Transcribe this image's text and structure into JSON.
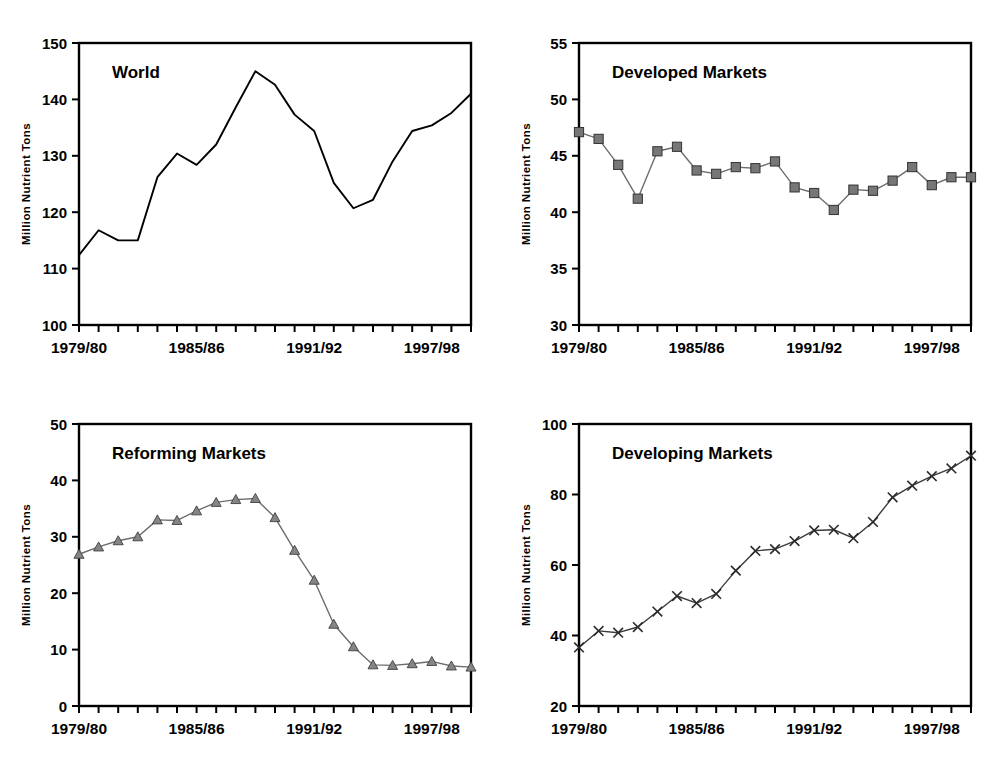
{
  "figure": {
    "panel_count": 4,
    "shared_ylabel": "Million Nutrient Tons",
    "shared_xtick_labels": [
      "1979/80",
      "1985/86",
      "1991/92",
      "1997/98"
    ],
    "shared_xtick_indices": [
      0,
      6,
      12,
      18
    ]
  },
  "chart_data": [
    {
      "type": "line",
      "title": "World",
      "xlabel": "",
      "ylabel": "Million Nutrient Tons",
      "ylim": [
        100,
        150
      ],
      "yticks": [
        100,
        110,
        120,
        130,
        140,
        150
      ],
      "xlim_labels": [
        "1979/80",
        "1999/2000"
      ],
      "grid": false,
      "legend": "none",
      "marker": "none",
      "categories": [
        "1979/80",
        "1980/81",
        "1981/82",
        "1982/83",
        "1983/84",
        "1984/85",
        "1985/86",
        "1986/87",
        "1987/88",
        "1988/89",
        "1989/90",
        "1990/91",
        "1991/92",
        "1992/93",
        "1993/94",
        "1994/95",
        "1995/96",
        "1996/97",
        "1997/98",
        "1998/99",
        "1999/00"
      ],
      "values": [
        112.4,
        116.8,
        115.0,
        115.0,
        126.2,
        130.4,
        128.4,
        132.0,
        138.6,
        145.0,
        142.6,
        137.3,
        134.4,
        125.2,
        120.7,
        122.2,
        129.0,
        134.4,
        135.4,
        137.6,
        141.0
      ]
    },
    {
      "type": "line",
      "title": "Developed Markets",
      "xlabel": "",
      "ylabel": "Million Nutrient Tons",
      "ylim": [
        30,
        55
      ],
      "yticks": [
        30,
        35,
        40,
        45,
        50,
        55
      ],
      "xlim_labels": [
        "1979/80",
        "1999/2000"
      ],
      "grid": false,
      "legend": "none",
      "marker": "square",
      "categories": [
        "1979/80",
        "1980/81",
        "1981/82",
        "1982/83",
        "1983/84",
        "1984/85",
        "1985/86",
        "1986/87",
        "1987/88",
        "1988/89",
        "1989/90",
        "1990/91",
        "1991/92",
        "1992/93",
        "1993/94",
        "1994/95",
        "1995/96",
        "1996/97",
        "1997/98",
        "1998/99",
        "1999/00"
      ],
      "values": [
        47.1,
        46.5,
        44.2,
        41.2,
        45.4,
        45.8,
        43.7,
        43.4,
        44.0,
        43.9,
        44.5,
        42.2,
        41.7,
        40.2,
        42.0,
        41.9,
        42.8,
        44.0,
        42.4,
        43.1,
        43.1
      ]
    },
    {
      "type": "line",
      "title": "Reforming Markets",
      "xlabel": "",
      "ylabel": "Million Nutrient Tons",
      "ylim": [
        0,
        50
      ],
      "yticks": [
        0,
        10,
        20,
        30,
        40,
        50
      ],
      "xlim_labels": [
        "1979/80",
        "1999/2000"
      ],
      "grid": false,
      "legend": "none",
      "marker": "triangle",
      "categories": [
        "1979/80",
        "1980/81",
        "1981/82",
        "1982/83",
        "1983/84",
        "1984/85",
        "1985/86",
        "1986/87",
        "1987/88",
        "1988/89",
        "1989/90",
        "1990/91",
        "1991/92",
        "1992/93",
        "1993/94",
        "1994/95",
        "1995/96",
        "1996/97",
        "1997/98",
        "1998/99",
        "1999/00"
      ],
      "values": [
        26.9,
        28.2,
        29.3,
        30.0,
        33.0,
        32.9,
        34.6,
        36.1,
        36.6,
        36.8,
        33.4,
        27.6,
        22.3,
        14.5,
        10.5,
        7.3,
        7.2,
        7.5,
        7.9,
        7.1,
        6.9
      ]
    },
    {
      "type": "line",
      "title": "Developing Markets",
      "xlabel": "",
      "ylabel": "Million Nutrient Tons",
      "ylim": [
        20,
        100
      ],
      "yticks": [
        20,
        40,
        60,
        80,
        100
      ],
      "xlim_labels": [
        "1979/80",
        "1999/2000"
      ],
      "grid": false,
      "legend": "none",
      "marker": "x",
      "categories": [
        "1979/80",
        "1980/81",
        "1981/82",
        "1982/83",
        "1983/84",
        "1984/85",
        "1985/86",
        "1986/87",
        "1987/88",
        "1988/89",
        "1989/90",
        "1990/91",
        "1991/92",
        "1992/93",
        "1993/94",
        "1994/95",
        "1995/96",
        "1996/97",
        "1997/98",
        "1998/99",
        "1999/00"
      ],
      "values": [
        36.6,
        41.3,
        40.8,
        42.4,
        46.8,
        51.2,
        49.2,
        51.8,
        58.4,
        64.0,
        64.5,
        66.8,
        69.8,
        70.0,
        67.6,
        72.2,
        79.2,
        82.5,
        85.2,
        87.4,
        91.0
      ]
    }
  ],
  "panels": [
    {
      "name": "world",
      "title": "World",
      "ylabel": "Million Nutrient Tons"
    },
    {
      "name": "developed-markets",
      "title": "Developed Markets",
      "ylabel": "Million Nutrient Tons"
    },
    {
      "name": "reforming-markets",
      "title": "Reforming Markets",
      "ylabel": "Million Nutrient Tons"
    },
    {
      "name": "developing-markets",
      "title": "Developing Markets",
      "ylabel": "Million Nutrient Tons"
    }
  ],
  "colors": {
    "background": "#ffffff",
    "axis": "#000000",
    "line_plain": "#000000",
    "line_marked": "#6d6d6d",
    "marker_fill": "#777777",
    "marker_stroke": "#333333"
  }
}
